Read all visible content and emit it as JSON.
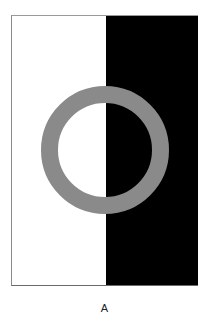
{
  "figure": {
    "label": "A",
    "colors": {
      "left_background": "#ffffff",
      "right_background": "#000000",
      "ring": "#8a8a8a"
    },
    "ring": {
      "cx": 105,
      "cy": 150,
      "outer_radius": 64,
      "inner_radius": 47
    }
  }
}
